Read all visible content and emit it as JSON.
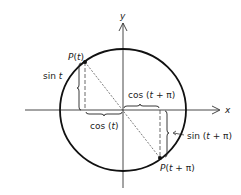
{
  "figure": {
    "type": "unit-circle-diagram",
    "colors": {
      "ink": "#222222",
      "background": "#ffffff"
    },
    "axes": {
      "x_label": "x",
      "y_label": "y"
    },
    "points": [
      {
        "name": "P(t)",
        "label": "P(t)"
      },
      {
        "name": "P(t+pi)",
        "label": "P(t + π)"
      }
    ],
    "labels": {
      "sin_t": "sin t",
      "cos_t": "cos (t)",
      "cos_t_pi": "cos (t + π)",
      "sin_t_pi": "sin (t + π)"
    }
  }
}
